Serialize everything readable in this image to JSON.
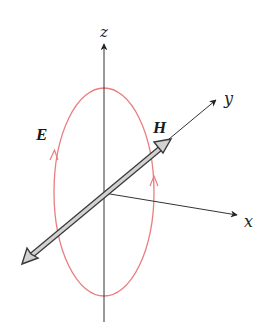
{
  "figure": {
    "type": "electromagnetic field diagram",
    "axes": {
      "z": {
        "label": "z"
      },
      "y": {
        "label": "y"
      },
      "x": {
        "label": "x"
      }
    },
    "fields": {
      "electric": {
        "label": "E",
        "shape": "closed loop (ellipse) with circulation arrows",
        "color": "#e8787a"
      },
      "magnetic": {
        "label": "H",
        "shape": "double-headed arrow along y-axis",
        "color": "#c8c8c8",
        "outline": "#444444"
      }
    },
    "colors": {
      "axis": "#333333",
      "loop": "#ea7d7f",
      "arrow_fill": "#cfcfcf",
      "arrow_outline": "#3a3a3a"
    }
  }
}
